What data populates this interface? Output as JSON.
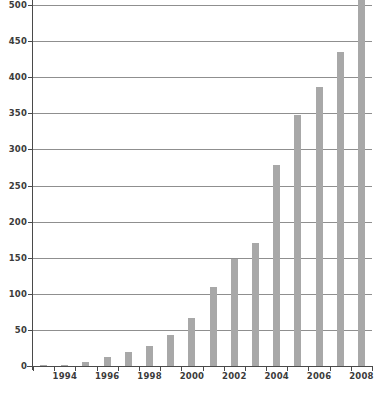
{
  "chart_data": {
    "type": "bar",
    "title": "",
    "subtitle": "",
    "xlabel": "",
    "ylabel": "",
    "categories": [
      "1993",
      "1994",
      "1995",
      "1996",
      "1997",
      "1998",
      "1999",
      "2000",
      "2001",
      "2002",
      "2003",
      "2004",
      "2005",
      "2006",
      "2007",
      "2008"
    ],
    "values": [
      1,
      2,
      6,
      12,
      19,
      28,
      43,
      66,
      110,
      148,
      170,
      278,
      348,
      387,
      435,
      510
    ],
    "ylim": [
      0,
      500
    ],
    "ytick_values": [
      0,
      50,
      100,
      150,
      200,
      250,
      300,
      350,
      400,
      450,
      500
    ],
    "ytick_labels": [
      "0",
      "50",
      "100",
      "150",
      "200",
      "250",
      "300",
      "350",
      "400",
      "450",
      "500"
    ],
    "xtick_labels": [
      "1994",
      "1996",
      "1998",
      "2000",
      "2002",
      "2004",
      "2006",
      "2008"
    ],
    "xtick_categories": [
      "1994",
      "1996",
      "1998",
      "2000",
      "2002",
      "2004",
      "2006",
      "2008"
    ],
    "grid": true,
    "gridlines": "horizontal",
    "legend": false,
    "legend_position": "none",
    "series": [
      {
        "name": "series-1",
        "color": "#a8a8a8",
        "values": [
          1,
          2,
          6,
          12,
          19,
          28,
          43,
          66,
          110,
          148,
          170,
          278,
          348,
          387,
          435,
          510
        ]
      }
    ],
    "colors": {
      "bar": "#a8a8a8",
      "gridline": "#8f8f8f",
      "axis": "#4a4a4a",
      "tick_text": "#3b3b3b",
      "background": "#ffffff"
    }
  },
  "footer": {
    "cropped_text": ""
  }
}
